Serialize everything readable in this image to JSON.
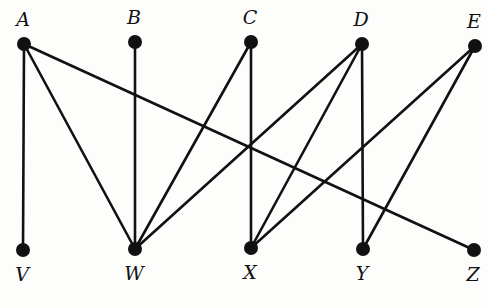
{
  "diagram": {
    "type": "bipartite-graph",
    "top_nodes": [
      {
        "id": "A",
        "label": "A",
        "x": 24,
        "y": 44
      },
      {
        "id": "B",
        "label": "B",
        "x": 135,
        "y": 42
      },
      {
        "id": "C",
        "label": "C",
        "x": 251,
        "y": 42
      },
      {
        "id": "D",
        "label": "D",
        "x": 362,
        "y": 44
      },
      {
        "id": "E",
        "label": "E",
        "x": 475,
        "y": 46
      }
    ],
    "bottom_nodes": [
      {
        "id": "V",
        "label": "V",
        "x": 23,
        "y": 250
      },
      {
        "id": "W",
        "label": "W",
        "x": 135,
        "y": 249
      },
      {
        "id": "X",
        "label": "X",
        "x": 251,
        "y": 248
      },
      {
        "id": "Y",
        "label": "Y",
        "x": 363,
        "y": 249
      },
      {
        "id": "Z",
        "label": "Z",
        "x": 474,
        "y": 250
      }
    ],
    "edges": [
      [
        "A",
        "V"
      ],
      [
        "A",
        "W"
      ],
      [
        "A",
        "Z"
      ],
      [
        "B",
        "W"
      ],
      [
        "C",
        "W"
      ],
      [
        "C",
        "X"
      ],
      [
        "D",
        "W"
      ],
      [
        "D",
        "X"
      ],
      [
        "D",
        "Y"
      ],
      [
        "E",
        "X"
      ],
      [
        "E",
        "Y"
      ]
    ],
    "colors": {
      "line": "#111111",
      "node": "#111111",
      "background": "#fdfdfc"
    }
  }
}
